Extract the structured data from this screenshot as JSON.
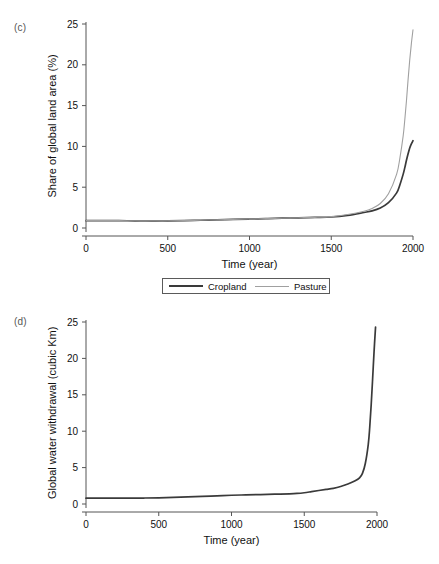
{
  "figure": {
    "background": "#ffffff",
    "panels": [
      {
        "id": "c",
        "label": "(c)",
        "xlabel": "Time (year)",
        "ylabel": "Share of global land area (%)"
      },
      {
        "id": "d",
        "label": "(d)",
        "xlabel": "Time (year)",
        "ylabel": "Global water withdrawal (cubic Km)"
      }
    ]
  },
  "legend": {
    "items": [
      {
        "label": "Cropland",
        "color": "#3a3a3a",
        "width": 2.2
      },
      {
        "label": "Pasture",
        "color": "#a0a0a0",
        "width": 1.2
      }
    ]
  },
  "chart_data": [
    {
      "type": "line",
      "panel": "c",
      "title": "",
      "xlabel": "Time (year)",
      "ylabel": "Share of global land area (%)",
      "xlim": [
        0,
        2000
      ],
      "ylim": [
        0,
        25
      ],
      "xticks": [
        0,
        500,
        1000,
        1500,
        2000
      ],
      "yticks": [
        0,
        5,
        10,
        15,
        20,
        25
      ],
      "xticklabels": [
        "0",
        "500",
        "1000",
        "1500",
        "2000"
      ],
      "yticklabels": [
        "0",
        "5",
        "10",
        "15",
        "20",
        "25"
      ],
      "grid": false,
      "legend_position": "below-axes",
      "x": [
        0,
        100,
        200,
        300,
        400,
        500,
        600,
        700,
        800,
        900,
        1000,
        1100,
        1200,
        1300,
        1400,
        1500,
        1600,
        1700,
        1750,
        1800,
        1850,
        1900,
        1920,
        1940,
        1950,
        1960,
        1970,
        1980,
        1990,
        2000
      ],
      "series": [
        {
          "name": "Cropland",
          "color": "#3a3a3a",
          "values": [
            0.9,
            0.9,
            0.9,
            0.88,
            0.88,
            0.88,
            0.9,
            0.95,
            1.0,
            1.05,
            1.1,
            1.15,
            1.2,
            1.25,
            1.3,
            1.35,
            1.55,
            1.9,
            2.1,
            2.45,
            3.1,
            4.3,
            5.3,
            6.6,
            7.4,
            8.3,
            9.1,
            9.8,
            10.3,
            10.7
          ]
        },
        {
          "name": "Pasture",
          "color": "#a0a0a0",
          "values": [
            0.9,
            0.9,
            0.9,
            0.88,
            0.88,
            0.88,
            0.9,
            0.95,
            1.0,
            1.05,
            1.1,
            1.15,
            1.2,
            1.25,
            1.3,
            1.4,
            1.65,
            2.05,
            2.4,
            3.0,
            4.2,
            6.6,
            8.6,
            11.3,
            13.3,
            15.6,
            18.2,
            20.6,
            22.6,
            24.3
          ]
        }
      ]
    },
    {
      "type": "line",
      "panel": "d",
      "title": "",
      "xlabel": "Time (year)",
      "ylabel": "Global water withdrawal (cubic Km)",
      "xlim": [
        0,
        2000
      ],
      "ylim": [
        0,
        25
      ],
      "xticks": [
        0,
        500,
        1000,
        1500,
        2000
      ],
      "yticks": [
        0,
        5,
        10,
        15,
        20,
        25
      ],
      "xticklabels": [
        "0",
        "500",
        "1000",
        "1500",
        "2000"
      ],
      "yticklabels": [
        "0",
        "5",
        "10",
        "15",
        "20",
        "25"
      ],
      "grid": false,
      "x": [
        0,
        100,
        200,
        300,
        400,
        500,
        600,
        700,
        800,
        900,
        1000,
        1100,
        1200,
        1300,
        1400,
        1450,
        1500,
        1550,
        1600,
        1650,
        1700,
        1750,
        1800,
        1850,
        1880,
        1900,
        1920,
        1940,
        1950,
        1960,
        1970,
        1980,
        1990
      ],
      "series": [
        {
          "name": "Global water withdrawal",
          "color": "#3a3a3a",
          "values": [
            0.8,
            0.8,
            0.8,
            0.8,
            0.82,
            0.85,
            0.9,
            0.97,
            1.05,
            1.12,
            1.2,
            1.25,
            1.3,
            1.35,
            1.4,
            1.45,
            1.55,
            1.7,
            1.85,
            2.0,
            2.15,
            2.4,
            2.75,
            3.2,
            3.6,
            4.2,
            5.6,
            8.2,
            10.5,
            13.6,
            17.2,
            21.0,
            24.3
          ]
        }
      ]
    }
  ]
}
